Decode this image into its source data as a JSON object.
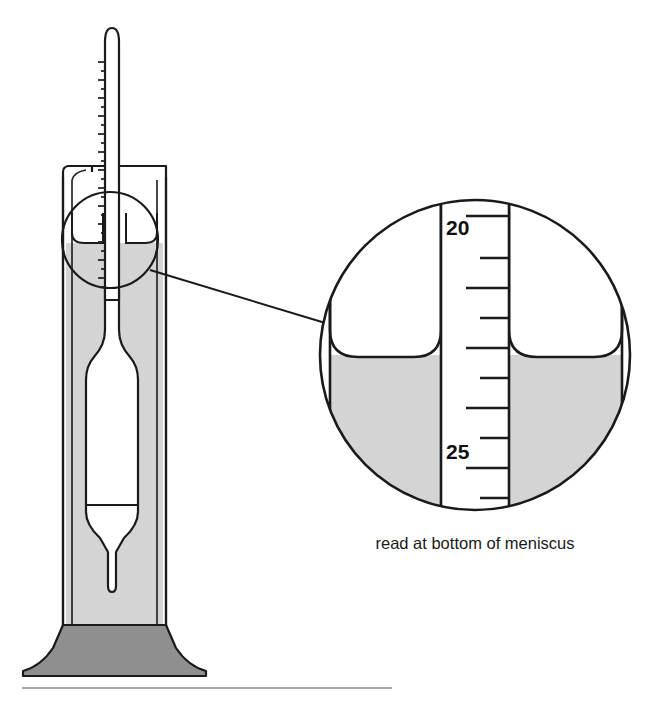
{
  "figure": {
    "caption": "read at bottom of meniscus",
    "colors": {
      "outline": "#1a1a1a",
      "liquid_fill": "#d4d4d4",
      "base_fill": "#8f8f8f",
      "glass_fill": "#ffffff",
      "background": "#ffffff",
      "rule": "#8a8a8a"
    }
  },
  "main_view": {
    "name": "graduated cylinder with floating hydrometer",
    "cylinder": {
      "label": "graduated cylinder",
      "has_pour_spout": true,
      "spout_side": "left"
    },
    "hydrometer": {
      "label": "hydrometer",
      "stem_label": "graduated stem",
      "bulb_label": "flotation bulb",
      "tip_label": "weighted tip"
    },
    "liquid": {
      "label": "liquid sample"
    },
    "base": {
      "label": "cylinder base"
    },
    "callout": {
      "label": "magnification callout circle",
      "leader_label": "callout leader line"
    }
  },
  "magnified_view": {
    "name": "magnified meniscus detail",
    "scale_labels": [
      "20",
      "25"
    ],
    "major_tick_values": [
      20,
      25
    ],
    "minor_ticks_between": 4,
    "reading_note": "read at bottom of meniscus",
    "elements": {
      "stem_label": "hydrometer stem",
      "meniscus_label": "liquid meniscus",
      "liquid_label": "liquid sample",
      "wall_label": "cylinder wall"
    }
  },
  "footer": {
    "rule_label": "horizontal divider rule"
  }
}
